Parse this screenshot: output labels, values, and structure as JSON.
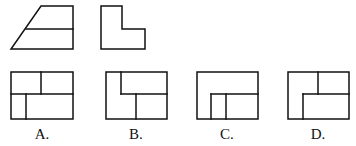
{
  "figure": {
    "given_views": [
      {
        "name": "front-view",
        "shape": "trapezoid-with-midline"
      },
      {
        "name": "side-view",
        "shape": "L-shape"
      }
    ],
    "options": [
      {
        "id": "A",
        "label": "A."
      },
      {
        "id": "B",
        "label": "B."
      },
      {
        "id": "C",
        "label": "C."
      },
      {
        "id": "D",
        "label": "D."
      }
    ],
    "colors": {
      "line": "#111111",
      "background": "#ffffff"
    }
  }
}
